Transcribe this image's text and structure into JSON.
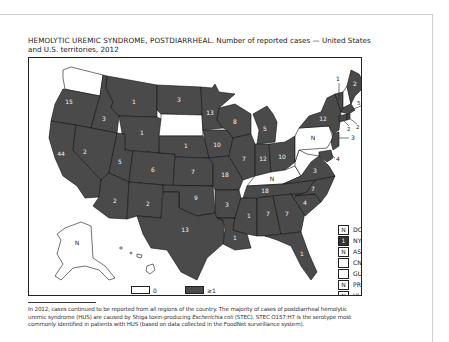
{
  "title": {
    "caps": "HEMOLYTIC UREMIC SYNDROME, POSTDIARRHEAL.",
    "rest": " Number of reported cases — United States and U.S. territories, 2012"
  },
  "map": {
    "fill_color": "#4a4a4a",
    "zero_color": "#ffffff",
    "states": [
      {
        "abbr": "WA",
        "value": "0",
        "zero": true
      },
      {
        "abbr": "OR",
        "value": "15"
      },
      {
        "abbr": "CA",
        "value": "44"
      },
      {
        "abbr": "ID",
        "value": "3"
      },
      {
        "abbr": "NV",
        "value": "2"
      },
      {
        "abbr": "MT",
        "value": "1"
      },
      {
        "abbr": "WY",
        "value": "1"
      },
      {
        "abbr": "UT",
        "value": "5"
      },
      {
        "abbr": "CO",
        "value": "6"
      },
      {
        "abbr": "AZ",
        "value": "2"
      },
      {
        "abbr": "NM",
        "value": "2"
      },
      {
        "abbr": "ND",
        "value": "3"
      },
      {
        "abbr": "SD",
        "value": "0",
        "zero": true
      },
      {
        "abbr": "NE",
        "value": "1"
      },
      {
        "abbr": "KS",
        "value": "7"
      },
      {
        "abbr": "OK",
        "value": "9"
      },
      {
        "abbr": "TX",
        "value": "13"
      },
      {
        "abbr": "MN",
        "value": "13"
      },
      {
        "abbr": "IA",
        "value": "10"
      },
      {
        "abbr": "MO",
        "value": "18"
      },
      {
        "abbr": "AR",
        "value": "3"
      },
      {
        "abbr": "LA",
        "value": "1"
      },
      {
        "abbr": "WI",
        "value": "8"
      },
      {
        "abbr": "IL",
        "value": "7"
      },
      {
        "abbr": "MI",
        "value": "5"
      },
      {
        "abbr": "IN",
        "value": "12"
      },
      {
        "abbr": "OH",
        "value": "10"
      },
      {
        "abbr": "KY",
        "value": "N",
        "zero": true
      },
      {
        "abbr": "TN",
        "value": "18"
      },
      {
        "abbr": "MS",
        "value": "1"
      },
      {
        "abbr": "AL",
        "value": "7"
      },
      {
        "abbr": "GA",
        "value": "7"
      },
      {
        "abbr": "FL",
        "value": "1"
      },
      {
        "abbr": "SC",
        "value": "4"
      },
      {
        "abbr": "NC",
        "value": "7"
      },
      {
        "abbr": "VA",
        "value": "3"
      },
      {
        "abbr": "WV",
        "value": "0",
        "zero": true
      },
      {
        "abbr": "PA",
        "value": "N",
        "zero": true
      },
      {
        "abbr": "NY",
        "value": "12"
      },
      {
        "abbr": "VT",
        "value": "1"
      },
      {
        "abbr": "NH",
        "value": "0",
        "zero": true
      },
      {
        "abbr": "ME",
        "value": "2"
      },
      {
        "abbr": "MA",
        "value": "5"
      },
      {
        "abbr": "RI",
        "value": "2"
      },
      {
        "abbr": "CT",
        "value": "2"
      },
      {
        "abbr": "NJ",
        "value": "3"
      },
      {
        "abbr": "MD",
        "value": "4"
      },
      {
        "abbr": "AK",
        "value": "N",
        "zero": true
      },
      {
        "abbr": "HI",
        "value": "0",
        "zero": true
      }
    ],
    "callouts": {
      "VT": "1",
      "MA": "5",
      "RI": "2",
      "CT": "2",
      "NJ": "3",
      "MD": "4"
    }
  },
  "territories": [
    {
      "name": "DC",
      "value": "N",
      "filled": false
    },
    {
      "name": "NYC",
      "value": "1",
      "filled": true
    },
    {
      "name": "AS",
      "value": "N",
      "filled": false
    },
    {
      "name": "CNMI",
      "value": "",
      "filled": false
    },
    {
      "name": "GU",
      "value": "",
      "filled": false
    },
    {
      "name": "PR",
      "value": "N",
      "filled": false
    },
    {
      "name": "VI",
      "value": "N",
      "filled": false
    }
  ],
  "legend": [
    {
      "label": "0",
      "color": "#ffffff"
    },
    {
      "label": "≥1",
      "color": "#4a4a4a"
    }
  ],
  "footnote": {
    "part1": "In 2012, cases continued to be reported from all regions of the country. The majority of cases of postdiarrheal hemolytic uremic syndrome (HUS) are caused by Shiga toxin-producing ",
    "italic": "Escherichia coli",
    "part2": " (STEC). STEC O157:H7 is the serotype most commonly identified in patients with HUS (based on data collected in the FoodNet surveillance system)."
  }
}
